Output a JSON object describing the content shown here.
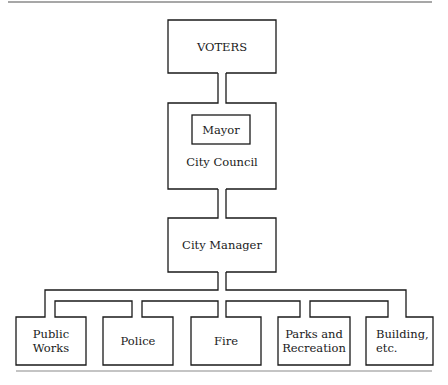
{
  "diagram": {
    "type": "org-chart",
    "title": "",
    "nodes": {
      "voters": "VOTERS",
      "mayor": "Mayor",
      "council": "City Council",
      "manager": "City Manager",
      "departments": [
        {
          "line1": "Public",
          "line2": "Works"
        },
        {
          "line1": "Police",
          "line2": ""
        },
        {
          "line1": "Fire",
          "line2": ""
        },
        {
          "line1": "Parks and",
          "line2": "Recreation"
        },
        {
          "line1": "Building,",
          "line2": "etc."
        }
      ]
    },
    "edges": [
      [
        "VOTERS",
        "City Council"
      ],
      [
        "City Council",
        "City Manager"
      ],
      [
        "City Manager",
        "Public Works"
      ],
      [
        "City Manager",
        "Police"
      ],
      [
        "City Manager",
        "Fire"
      ],
      [
        "City Manager",
        "Parks and Recreation"
      ],
      [
        "City Manager",
        "Building, etc."
      ]
    ],
    "colors": {
      "line": "#1a1a1a",
      "background": "#ffffff",
      "rule": "#8a8a8a"
    }
  }
}
